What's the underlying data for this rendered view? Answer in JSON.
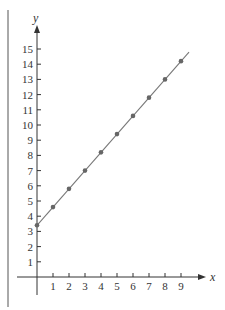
{
  "chart_data": {
    "type": "line",
    "title": "",
    "xlabel": "x",
    "ylabel": "y",
    "xlim": [
      0,
      9
    ],
    "ylim": [
      0,
      15
    ],
    "x_ticks": [
      1,
      2,
      3,
      4,
      5,
      6,
      7,
      8,
      9
    ],
    "y_ticks": [
      1,
      2,
      3,
      4,
      5,
      6,
      7,
      8,
      9,
      10,
      11,
      12,
      13,
      14,
      15
    ],
    "grid": false,
    "legend": null,
    "series": [
      {
        "name": "line",
        "x": [
          0,
          1,
          2,
          3,
          4,
          5,
          6,
          7,
          8,
          9
        ],
        "values": [
          3.4,
          4.6,
          5.8,
          7.0,
          8.2,
          9.4,
          10.6,
          11.8,
          13.0,
          14.2
        ],
        "markers": true,
        "line_extends_to_x": 9.5
      }
    ]
  },
  "colors": {
    "axis": "#333333",
    "line": "#777777",
    "marker": "#666666",
    "border": "#555555"
  }
}
